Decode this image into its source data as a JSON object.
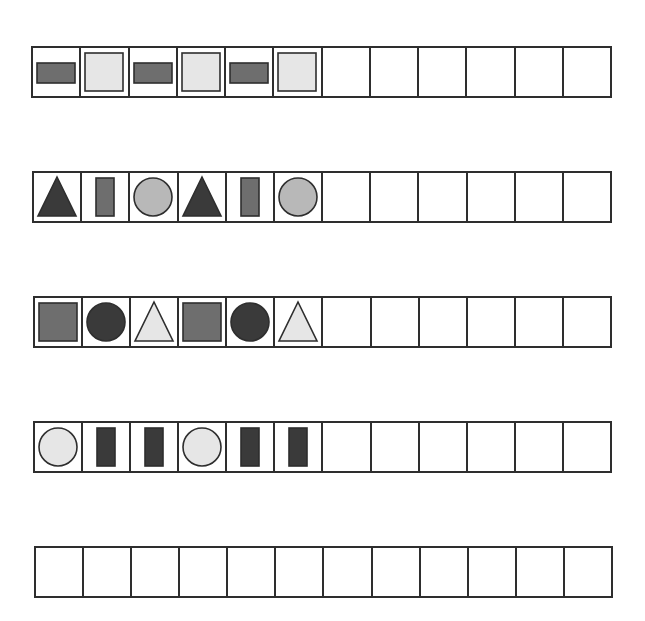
{
  "worksheet": {
    "cells_per_row": 12,
    "colors": {
      "dark": "#3a3a3a",
      "medium": "#6e6e6e",
      "light": "#b8b8b8",
      "pale": "#e6e6e6",
      "outline": "#2e2e2e"
    },
    "rows": [
      {
        "id": "row-1",
        "pattern": [
          {
            "shape": "wide-rectangle",
            "fill": "medium"
          },
          {
            "shape": "square",
            "fill": "pale"
          },
          {
            "shape": "wide-rectangle",
            "fill": "medium"
          },
          {
            "shape": "square",
            "fill": "pale"
          },
          {
            "shape": "wide-rectangle",
            "fill": "medium"
          },
          {
            "shape": "square",
            "fill": "pale"
          }
        ],
        "empty_cells": 6
      },
      {
        "id": "row-2",
        "pattern": [
          {
            "shape": "triangle",
            "fill": "dark"
          },
          {
            "shape": "tall-rectangle",
            "fill": "medium"
          },
          {
            "shape": "circle",
            "fill": "light"
          },
          {
            "shape": "triangle",
            "fill": "dark"
          },
          {
            "shape": "tall-rectangle",
            "fill": "medium"
          },
          {
            "shape": "circle",
            "fill": "light"
          }
        ],
        "empty_cells": 6
      },
      {
        "id": "row-3",
        "pattern": [
          {
            "shape": "square",
            "fill": "medium"
          },
          {
            "shape": "circle",
            "fill": "dark"
          },
          {
            "shape": "triangle",
            "fill": "pale"
          },
          {
            "shape": "square",
            "fill": "medium"
          },
          {
            "shape": "circle",
            "fill": "dark"
          },
          {
            "shape": "triangle",
            "fill": "pale"
          }
        ],
        "empty_cells": 6
      },
      {
        "id": "row-4",
        "pattern": [
          {
            "shape": "circle",
            "fill": "pale"
          },
          {
            "shape": "tall-rectangle",
            "fill": "dark"
          },
          {
            "shape": "tall-rectangle",
            "fill": "dark"
          },
          {
            "shape": "circle",
            "fill": "pale"
          },
          {
            "shape": "tall-rectangle",
            "fill": "dark"
          },
          {
            "shape": "tall-rectangle",
            "fill": "dark"
          }
        ],
        "empty_cells": 6
      },
      {
        "id": "row-5",
        "pattern": [],
        "empty_cells": 12
      }
    ]
  }
}
